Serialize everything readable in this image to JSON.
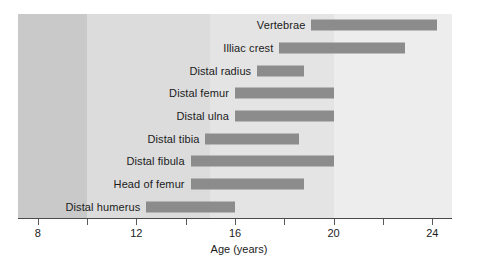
{
  "chart_data": {
    "type": "bar",
    "orientation": "horizontal",
    "subtype": "range-bar",
    "title": "",
    "xlabel": "Age (years)",
    "ylabel": "",
    "xlim": [
      7.2,
      24.8
    ],
    "xticks": [
      8,
      10,
      12,
      14,
      16,
      18,
      20,
      22,
      24
    ],
    "xtick_labels": [
      "8",
      "",
      "12",
      "",
      "16",
      "",
      "20",
      "",
      "24"
    ],
    "grid": false,
    "legend": null,
    "categories": [
      "Vertebrae",
      "Illiac crest",
      "Distal radius",
      "Distal femur",
      "Distal ulna",
      "Distal tibia",
      "Distal fibula",
      "Head of femur",
      "Distal humerus"
    ],
    "ranges": [
      {
        "label": "Vertebrae",
        "start": 19.1,
        "end": 24.2
      },
      {
        "label": "Illiac crest",
        "start": 17.8,
        "end": 22.9
      },
      {
        "label": "Distal radius",
        "start": 16.9,
        "end": 18.8
      },
      {
        "label": "Distal femur",
        "start": 16.0,
        "end": 20.0
      },
      {
        "label": "Distal ulna",
        "start": 16.0,
        "end": 20.0
      },
      {
        "label": "Distal tibia",
        "start": 14.8,
        "end": 18.6
      },
      {
        "label": "Distal fibula",
        "start": 14.2,
        "end": 20.0
      },
      {
        "label": "Head of femur",
        "start": 14.2,
        "end": 18.8
      },
      {
        "label": "Distal humerus",
        "start": 12.4,
        "end": 16.0
      }
    ],
    "background_bands": [
      {
        "start": 7.2,
        "end": 10.0,
        "color": "#c9c9c9"
      },
      {
        "start": 10.0,
        "end": 15.0,
        "color": "#dcdcdc"
      },
      {
        "start": 15.0,
        "end": 20.0,
        "color": "#e4e4e4"
      },
      {
        "start": 20.0,
        "end": 24.8,
        "color": "#ededed"
      }
    ],
    "bar_color": "#8c8c8c",
    "text_color": "#1b1b1b",
    "axis_color": "#4a4a4a"
  },
  "labels": {
    "axis_title": "Age (years)",
    "t0": "8",
    "t1": "12",
    "t2": "16",
    "t3": "20",
    "t4": "24",
    "b0": "Vertebrae",
    "b1": "Illiac crest",
    "b2": "Distal radius",
    "b3": "Distal femur",
    "b4": "Distal ulna",
    "b5": "Distal tibia",
    "b6": "Distal fibula",
    "b7": "Head of femur",
    "b8": "Distal humerus"
  }
}
